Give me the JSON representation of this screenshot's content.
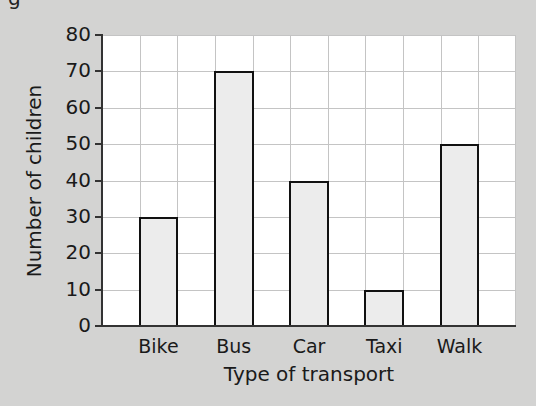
{
  "chart_data": {
    "type": "bar",
    "title": "",
    "xlabel": "Type of transport",
    "ylabel": "Number of children",
    "categories": [
      "Bike",
      "Bus",
      "Car",
      "Taxi",
      "Walk"
    ],
    "values": [
      30,
      70,
      40,
      10,
      50
    ],
    "ylim": [
      0,
      80
    ],
    "yticks": [
      0,
      10,
      20,
      30,
      40,
      50,
      60,
      70,
      80
    ],
    "grid": true,
    "legend": null,
    "colors": {
      "background": "#d3d3d2",
      "plot_background": "#ffffff",
      "bar_fill": "#ececec",
      "bar_edge": "#111111",
      "grid": "#c4c4c4"
    }
  },
  "partial_heading_fragment": "g"
}
